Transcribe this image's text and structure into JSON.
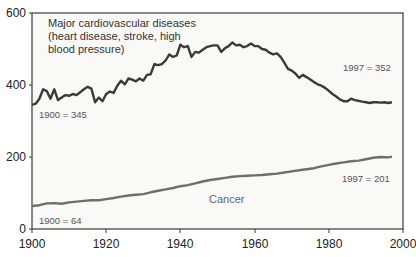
{
  "chart_data": {
    "type": "line",
    "title": "",
    "xlabel": "",
    "ylabel": "",
    "xlim": [
      1900,
      2000
    ],
    "ylim": [
      0,
      600
    ],
    "x_ticks": [
      "1900",
      "1920",
      "1940",
      "1960",
      "1980",
      "2000"
    ],
    "y_ticks": [
      "0",
      "200",
      "400",
      "600"
    ],
    "grid": false,
    "legend": "none (inline labels)",
    "series": [
      {
        "name": "Major cardiovascular diseases (heart disease, stroke, high blood pressure)",
        "color": "#3a3a3a",
        "x": [
          1900,
          1901,
          1902,
          1903,
          1904,
          1905,
          1906,
          1907,
          1908,
          1909,
          1910,
          1911,
          1912,
          1913,
          1914,
          1915,
          1916,
          1917,
          1918,
          1919,
          1920,
          1921,
          1922,
          1923,
          1924,
          1925,
          1926,
          1927,
          1928,
          1929,
          1930,
          1931,
          1932,
          1933,
          1934,
          1935,
          1936,
          1937,
          1938,
          1939,
          1940,
          1941,
          1942,
          1943,
          1944,
          1945,
          1946,
          1947,
          1948,
          1949,
          1950,
          1951,
          1952,
          1953,
          1954,
          1955,
          1956,
          1957,
          1958,
          1959,
          1960,
          1961,
          1962,
          1963,
          1964,
          1965,
          1966,
          1967,
          1968,
          1969,
          1970,
          1971,
          1972,
          1973,
          1974,
          1975,
          1976,
          1977,
          1978,
          1979,
          1980,
          1981,
          1982,
          1983,
          1984,
          1985,
          1986,
          1987,
          1988,
          1989,
          1990,
          1991,
          1992,
          1993,
          1994,
          1995,
          1996,
          1997
        ],
        "values": [
          345,
          348,
          362,
          388,
          383,
          362,
          388,
          358,
          365,
          372,
          370,
          375,
          372,
          380,
          388,
          395,
          390,
          352,
          365,
          355,
          375,
          382,
          378,
          398,
          412,
          402,
          418,
          415,
          410,
          418,
          412,
          428,
          430,
          458,
          455,
          458,
          468,
          485,
          478,
          482,
          512,
          505,
          508,
          478,
          492,
          490,
          498,
          505,
          508,
          510,
          510,
          492,
          502,
          508,
          518,
          510,
          512,
          505,
          508,
          515,
          508,
          508,
          500,
          498,
          490,
          485,
          488,
          478,
          462,
          445,
          440,
          432,
          420,
          428,
          422,
          415,
          408,
          402,
          398,
          392,
          384,
          375,
          368,
          360,
          355,
          355,
          362,
          358,
          356,
          354,
          352,
          350,
          352,
          352,
          351,
          352,
          350,
          352
        ],
        "annotations": [
          {
            "text": "1900 = 345",
            "x": 1900,
            "y": 345
          },
          {
            "text": "1997 = 352",
            "x": 1997,
            "y": 352
          }
        ]
      },
      {
        "name": "Cancer",
        "color": "#6e6e6e",
        "x": [
          1900,
          1902,
          1904,
          1906,
          1908,
          1910,
          1912,
          1914,
          1916,
          1918,
          1920,
          1922,
          1924,
          1926,
          1928,
          1930,
          1932,
          1934,
          1936,
          1938,
          1940,
          1942,
          1944,
          1946,
          1948,
          1950,
          1952,
          1954,
          1956,
          1958,
          1960,
          1962,
          1964,
          1966,
          1968,
          1970,
          1972,
          1974,
          1976,
          1978,
          1980,
          1982,
          1984,
          1986,
          1988,
          1990,
          1992,
          1994,
          1996,
          1997
        ],
        "values": [
          64,
          66,
          71,
          72,
          70,
          74,
          76,
          78,
          80,
          80,
          83,
          86,
          90,
          93,
          95,
          97,
          102,
          106,
          110,
          114,
          119,
          122,
          127,
          132,
          136,
          139,
          142,
          145,
          147,
          148,
          149,
          150,
          152,
          154,
          157,
          160,
          163,
          166,
          169,
          174,
          178,
          182,
          185,
          188,
          190,
          194,
          198,
          200,
          199,
          201
        ],
        "annotations": [
          {
            "text": "1900 = 64",
            "x": 1900,
            "y": 64
          },
          {
            "text": "1997 = 201",
            "x": 1997,
            "y": 201
          }
        ]
      }
    ]
  },
  "labels": {
    "cvd_line1": "Major cardiovascular diseases",
    "cvd_line2": "(heart disease, stroke, high",
    "cvd_line3": "blood pressure)",
    "cvd_start": "1900 = 345",
    "cvd_end": "1997 = 352",
    "cancer": "Cancer",
    "cancer_start": "1900 = 64",
    "cancer_end": "1997 = 201"
  },
  "axes": {
    "x_ticks": [
      "1900",
      "1920",
      "1940",
      "1960",
      "1980",
      "2000"
    ],
    "y_ticks": [
      "0",
      "200",
      "400",
      "600"
    ]
  }
}
